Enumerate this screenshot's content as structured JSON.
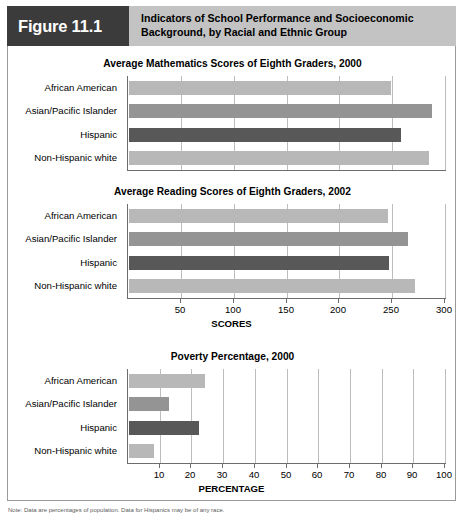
{
  "header": {
    "figure_tag": "Figure 11.1",
    "title": "Indicators of School Performance and Socioeconomic Background, by Racial and Ethnic Group"
  },
  "categories": [
    "African American",
    "Asian/Pacific Islander",
    "Hispanic",
    "Non-Hispanic white"
  ],
  "colors": {
    "bar_light": "#b8b8b8",
    "bar_medium": "#949494",
    "bar_dark": "#585858",
    "tag_bg": "#3b3b3b",
    "title_bg": "#c3c3c3",
    "grid": "#bdbdbd",
    "axis": "#6d6d6d"
  },
  "footnote": "Note: Data are percentages of population. Data for Hispanics may be of any race.",
  "chart_data": [
    {
      "type": "bar",
      "orientation": "horizontal",
      "title": "Average Mathematics Scores of Eighth Graders, 2000",
      "categories": [
        "African American",
        "Asian/Pacific Islander",
        "Hispanic",
        "Non-Hispanic white"
      ],
      "values": [
        248,
        287,
        257,
        284
      ],
      "bar_colors": [
        "#b8b8b8",
        "#949494",
        "#585858",
        "#b8b8b8"
      ],
      "xlabel": "",
      "ylabel": "",
      "xlim": [
        0,
        300
      ],
      "xticks": [
        50,
        100,
        150,
        200,
        250,
        300
      ],
      "xtick_labels": [
        "",
        "",
        "",
        "",
        "",
        ""
      ],
      "grid": true,
      "show_axis_labels": false
    },
    {
      "type": "bar",
      "orientation": "horizontal",
      "title": "Average Reading Scores of Eighth Graders, 2002",
      "categories": [
        "African American",
        "Asian/Pacific Islander",
        "Hispanic",
        "Non-Hispanic white"
      ],
      "values": [
        245,
        264,
        246,
        271
      ],
      "bar_colors": [
        "#b8b8b8",
        "#949494",
        "#585858",
        "#b8b8b8"
      ],
      "xlabel": "SCORES",
      "ylabel": "",
      "xlim": [
        0,
        300
      ],
      "xticks": [
        50,
        100,
        150,
        200,
        250,
        300
      ],
      "xtick_labels": [
        "50",
        "100",
        "150",
        "200",
        "250",
        "300"
      ],
      "grid": true,
      "show_axis_labels": true
    },
    {
      "type": "bar",
      "orientation": "horizontal",
      "title": "Poverty Percentage, 2000",
      "categories": [
        "African American",
        "Asian/Pacific Islander",
        "Hispanic",
        "Non-Hispanic white"
      ],
      "values": [
        24,
        12.5,
        22,
        8
      ],
      "bar_colors": [
        "#b8b8b8",
        "#949494",
        "#585858",
        "#b8b8b8"
      ],
      "xlabel": "PERCENTAGE",
      "ylabel": "",
      "xlim": [
        0,
        100
      ],
      "xticks": [
        10,
        20,
        30,
        40,
        50,
        60,
        70,
        80,
        90,
        100
      ],
      "xtick_labels": [
        "10",
        "20",
        "30",
        "40",
        "50",
        "60",
        "70",
        "80",
        "90",
        "100"
      ],
      "grid": true,
      "show_axis_labels": true
    }
  ]
}
